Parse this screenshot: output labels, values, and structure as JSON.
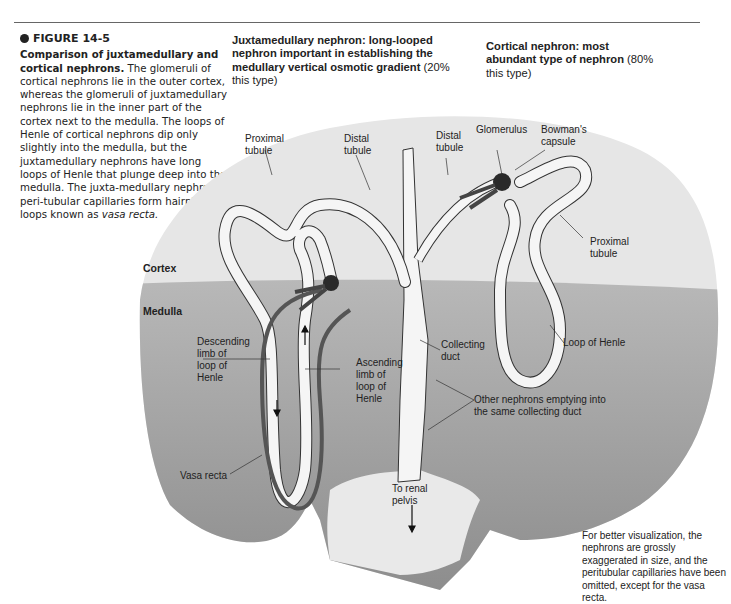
{
  "figure": {
    "number": "FIGURE 14-5",
    "title": "Comparison of juxtamedullary and cortical nephrons.",
    "caption_lines": [
      "The glomeruli of cortical nephrons lie in the outer cortex, whereas the glomeruli of juxtamedullary nephrons lie in the inner part of the cortex next to the medulla. The loops of Henle of cortical nephrons dip only slightly into the medulla, but the juxtamedullary nephrons have long loops of Henle that plunge deep into the medulla. The juxta-medullary nephrons' peri-tubular capillaries form hairpin loops known as"
    ],
    "caption_italic": "vasa recta."
  },
  "headings": {
    "juxtamedullary": {
      "bold": "Juxtamedullary nephron: long-looped nephron important in establishing the medullary vertical osmotic gradient",
      "normal": "(20% this type)"
    },
    "cortical": {
      "bold": "Cortical nephron: most abundant type of nephron",
      "normal": "(80% this type)"
    }
  },
  "zones": {
    "cortex": "Cortex",
    "medulla": "Medulla"
  },
  "labels": {
    "proximal_tubule_left": "Proximal\ntubule",
    "distal_tubule_left": "Distal\ntubule",
    "distal_tubule_top": "Distal\ntubule",
    "glomerulus": "Glomerulus",
    "bowmans_capsule": "Bowman's\ncapsule",
    "proximal_tubule_right": "Proximal\ntubule",
    "loop_of_henle": "Loop of Henle",
    "collecting_duct": "Collecting\nduct",
    "descending_limb": "Descending\nlimb of\nloop of\nHenle",
    "ascending_limb": "Ascending\nlimb of\nloop of\nHenle",
    "other_nephrons": "Other nephrons emptying into\nthe same collecting duct",
    "vasa_recta": "Vasa recta",
    "to_renal_pelvis": "To renal\npelvis"
  },
  "footnote": "For better visualization, the nephrons are grossly exaggerated in size, and the peritubular capillaries have been omitted, except for the vasa recta.",
  "colors": {
    "cortex": "#e6e6e6",
    "medulla_top": "#b4b4b4",
    "medulla_bottom": "#8a8a8a",
    "tubule": "#f4f4f4",
    "vessel": "#555555",
    "glomerulus": "#2a2a2a"
  }
}
